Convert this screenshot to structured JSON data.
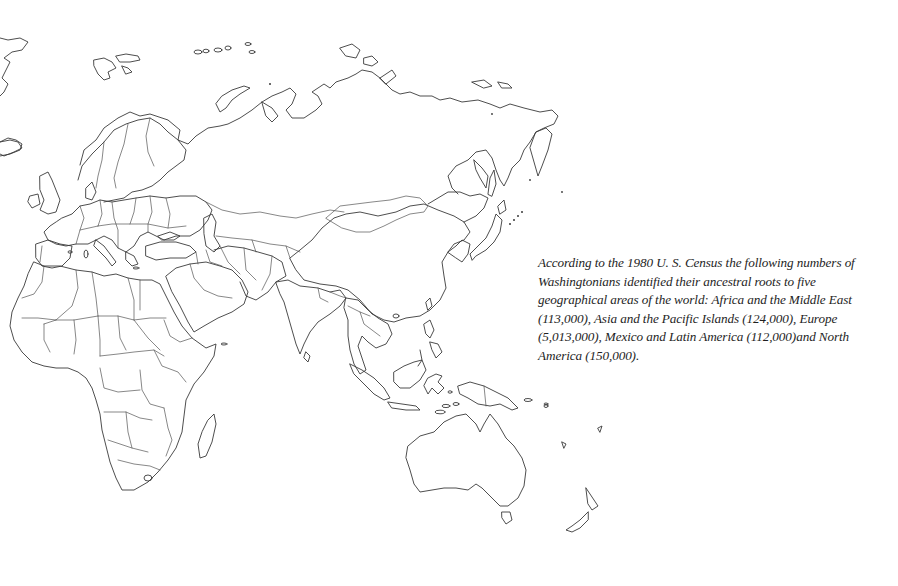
{
  "caption": {
    "text": "According to the 1980 U. S. Census the following numbers of Washingtonians identified their ancestral roots to five geographical areas of the world:  Africa and the Middle East (113,000), Asia and the Pacific Islands (124,000), Europe (5,013,000), Mexico and Latin America (112,000)and North America (150,000).",
    "census_year": "1980",
    "regions": [
      {
        "name": "Africa and the Middle East",
        "count": "113,000"
      },
      {
        "name": "Asia and the Pacific Islands",
        "count": "124,000"
      },
      {
        "name": "Europe",
        "count": "5,013,000"
      },
      {
        "name": "Mexico and Latin America",
        "count": "112,000"
      },
      {
        "name": "North America",
        "count": "150,000"
      }
    ]
  },
  "map": {
    "style": "outline",
    "line_color": "#3a3a3a",
    "background": "#ffffff",
    "regions_shown": [
      "Europe",
      "Africa",
      "Middle East",
      "Asia",
      "Australia",
      "Oceania"
    ]
  }
}
